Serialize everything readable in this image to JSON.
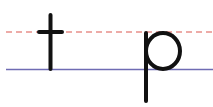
{
  "letters": [
    "t",
    "p"
  ],
  "colors": {
    "midline": "#e8908a",
    "baseline": "#6f6cb4",
    "stroke": "#111111",
    "background": "#ffffff"
  },
  "guides": {
    "midline_style": "dashed",
    "baseline_style": "solid"
  }
}
